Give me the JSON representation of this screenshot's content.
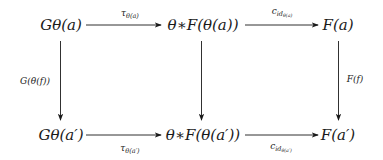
{
  "diagram": {
    "type": "commutative-diagram",
    "nodes": {
      "top_left": "Gθ(a)",
      "top_mid": "θ∗F(θ(a))",
      "top_right": "F(a)",
      "bot_left": "Gθ(a′)",
      "bot_mid": "θ∗F(θ(a′))",
      "bot_right": "F(a′)"
    },
    "edges": {
      "top_left_to_mid": {
        "base": "τ",
        "sub": "θ(a)"
      },
      "top_mid_to_right": {
        "base": "c",
        "sub": "id",
        "subsub": "θ(a)"
      },
      "bot_left_to_mid": {
        "base": "τ",
        "sub": "θ(a′)"
      },
      "bot_mid_to_right": {
        "base": "c",
        "sub": "id",
        "subsub": "θ(a′)"
      },
      "left_vertical": "G(θ(f))",
      "mid_vertical": "",
      "right_vertical": "F(f)"
    },
    "colors": {
      "ink": "#1a1a1a",
      "background": "#ffffff"
    }
  }
}
